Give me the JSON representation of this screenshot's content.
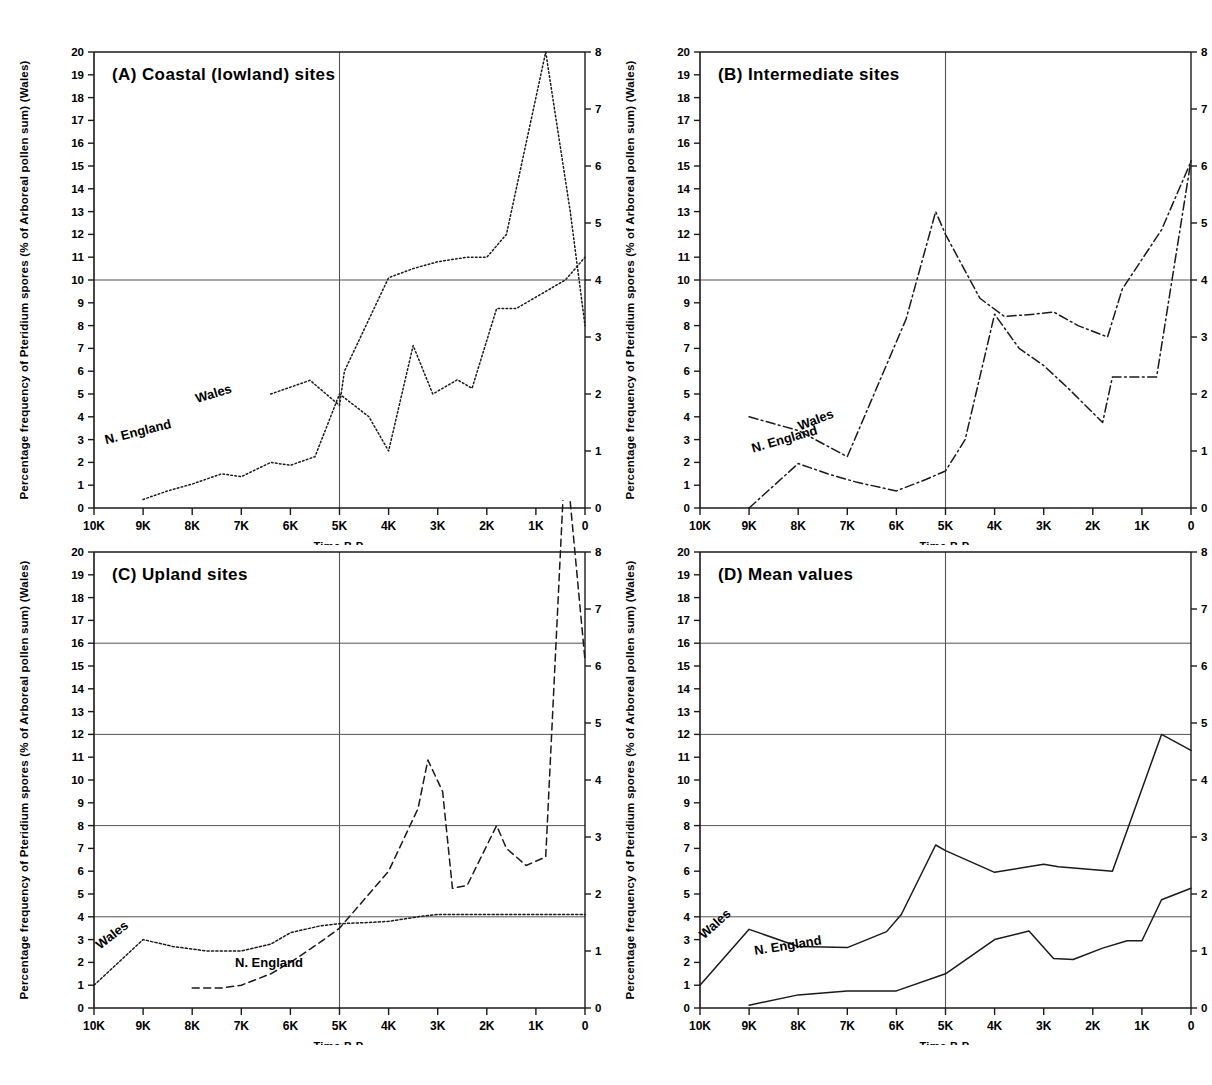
{
  "figure": {
    "background": "#ffffff",
    "line_color": "#1a1a1a",
    "grid_color": "#555555",
    "axis_label_left": "Percentage frequency of Pteridium spores (% of Arboreal pollen sum) (Wales)",
    "axis_label_right_line1": "Percentage frequency of Pteridium spores",
    "axis_label_right_line2": "(% of total Terrestrial pollen) (N. England)",
    "xaxis_title": "Time B.P.",
    "series_label_wales": "Wales",
    "series_label_nengland": "N. England",
    "left_axis_ticks": [
      "0",
      "1",
      "2",
      "3",
      "4",
      "5",
      "6",
      "7",
      "8",
      "9",
      "10",
      "11",
      "12",
      "13",
      "14",
      "15",
      "16",
      "17",
      "18",
      "19",
      "20"
    ],
    "right_axis_ticks": [
      "0",
      "1",
      "2",
      "3",
      "4",
      "5",
      "6",
      "7",
      "8"
    ],
    "x_axis_ticks": [
      "10K",
      "9K",
      "8K",
      "7K",
      "6K",
      "5K",
      "4K",
      "3K",
      "2K",
      "1K",
      "0"
    ]
  },
  "chart_data": [
    {
      "id": "A",
      "type": "line",
      "title": "(A)  Coastal (lowland) sites",
      "xlabel": "Time B.P.",
      "ylabel": "Percentage frequency of Pteridium spores (% of Arboreal pollen sum) (Wales)",
      "ylabel_right": "Percentage frequency of Pteridium spores (% of total Terrestrial pollen) (N. England)",
      "xlim": [
        10000,
        0
      ],
      "ylim_left": [
        0,
        20
      ],
      "ylim_right": [
        0,
        8
      ],
      "grid": true,
      "gridlines_y": [
        10
      ],
      "gridlines_x": [
        5000
      ],
      "legend_position": "inline-annotation",
      "series": [
        {
          "name": "Wales",
          "axis": "left",
          "linestyle": "dotted",
          "x": [
            6400,
            5600,
            5000,
            4900,
            4000,
            3500,
            3000,
            2400,
            2000,
            1600,
            800,
            300,
            0
          ],
          "values": [
            5.0,
            5.6,
            4.5,
            6.0,
            10.1,
            10.5,
            10.8,
            11.0,
            11.0,
            12.0,
            20.0,
            13.0,
            8.0
          ]
        },
        {
          "name": "N. England",
          "axis": "right",
          "linestyle": "dotted",
          "x": [
            9000,
            8500,
            8000,
            7400,
            7000,
            6400,
            6000,
            5500,
            5000,
            4400,
            4000,
            3500,
            3100,
            2600,
            2300,
            1800,
            1400,
            800,
            400,
            0
          ],
          "values": [
            0.15,
            0.3,
            0.42,
            0.6,
            0.55,
            0.8,
            0.75,
            0.9,
            2.0,
            1.6,
            1.0,
            2.85,
            2.0,
            2.25,
            2.1,
            3.5,
            3.5,
            3.8,
            4.0,
            4.4
          ]
        }
      ]
    },
    {
      "id": "B",
      "type": "line",
      "title": "(B)  Intermediate sites",
      "xlabel": "Time B.P.",
      "ylabel": "Percentage frequency of Pteridium spores (% of Arboreal pollen sum) (Wales)",
      "ylabel_right": "Percentage frequency of Pteridium spores (% of total Terrestrial pollen) (N. England)",
      "xlim": [
        10000,
        0
      ],
      "ylim_left": [
        0,
        20
      ],
      "ylim_right": [
        0,
        8
      ],
      "grid": true,
      "gridlines_y": [
        10
      ],
      "gridlines_x": [
        5000
      ],
      "legend_position": "inline-annotation",
      "series": [
        {
          "name": "Wales",
          "axis": "left",
          "linestyle": "dashdot",
          "x": [
            9000,
            8000,
            7000,
            5800,
            5200,
            5000,
            4300,
            3800,
            3200,
            2800,
            2300,
            1700,
            1400,
            600,
            0
          ],
          "values": [
            4.0,
            3.4,
            2.25,
            8.3,
            13.0,
            12.0,
            9.2,
            8.4,
            8.5,
            8.6,
            8.0,
            7.5,
            9.6,
            12.2,
            15.2
          ]
        },
        {
          "name": "N. England",
          "axis": "right",
          "linestyle": "dashdot",
          "x": [
            9000,
            8000,
            7400,
            6800,
            6000,
            5400,
            5000,
            4600,
            4000,
            3500,
            3000,
            2500,
            1800,
            1600,
            1000,
            700,
            0
          ],
          "values": [
            0.0,
            0.78,
            0.6,
            0.45,
            0.3,
            0.5,
            0.65,
            1.2,
            3.4,
            2.8,
            2.5,
            2.1,
            1.5,
            2.3,
            2.3,
            2.3,
            6.1
          ]
        }
      ]
    },
    {
      "id": "C",
      "type": "line",
      "title": "(C)  Upland sites",
      "xlabel": "Time B.P.",
      "ylabel": "Percentage frequency of Pteridium spores (% of Arboreal pollen sum) (Wales)",
      "ylabel_right": "Percentage frequency of Pteridium spores (% of total Terrestrial pollen) (N. England)",
      "xlim": [
        10000,
        0
      ],
      "ylim_left": [
        0,
        20
      ],
      "ylim_right": [
        0,
        8
      ],
      "grid": true,
      "gridlines_y": [
        4,
        8,
        12,
        16
      ],
      "gridlines_x": [
        5000
      ],
      "legend_position": "inline-annotation",
      "series": [
        {
          "name": "Wales",
          "axis": "left",
          "linestyle": "dotted-fine",
          "x": [
            10000,
            9000,
            8400,
            7700,
            7000,
            6400,
            6000,
            5400,
            5000,
            4400,
            4000,
            3400,
            3000,
            2500,
            2000,
            1500,
            1000,
            500,
            0
          ],
          "values": [
            1.0,
            3.0,
            2.7,
            2.5,
            2.5,
            2.8,
            3.3,
            3.6,
            3.7,
            3.75,
            3.8,
            4.0,
            4.1,
            4.1,
            4.1,
            4.1,
            4.1,
            4.1,
            4.1
          ]
        },
        {
          "name": "N. England",
          "axis": "right",
          "linestyle": "dashed",
          "x": [
            8000,
            7400,
            7000,
            6400,
            6000,
            5400,
            5000,
            4500,
            4000,
            3400,
            3200,
            2900,
            2700,
            2400,
            1800,
            1600,
            1200,
            800,
            400,
            0
          ],
          "values": [
            0.35,
            0.35,
            0.4,
            0.6,
            0.8,
            1.15,
            1.4,
            1.9,
            2.4,
            3.5,
            4.35,
            3.8,
            2.1,
            2.15,
            3.2,
            2.8,
            2.5,
            2.65,
            9.8,
            6.1
          ]
        }
      ]
    },
    {
      "id": "D",
      "type": "line",
      "title": "(D)  Mean values",
      "xlabel": "Time B.P.",
      "ylabel": "Percentage frequency of Pteridium spores (% of Arboreal pollen sum) (Wales)",
      "ylabel_right": "Percentage frequency of Pteridium spores (% of total Terrestrial pollen) (N. England)",
      "xlim": [
        10000,
        0
      ],
      "ylim_left": [
        0,
        20
      ],
      "ylim_right": [
        0,
        8
      ],
      "grid": true,
      "gridlines_y": [
        4,
        8,
        12,
        16
      ],
      "gridlines_x": [
        5000
      ],
      "legend_position": "inline-annotation",
      "series": [
        {
          "name": "Wales",
          "axis": "left",
          "linestyle": "solid",
          "x": [
            10000,
            9000,
            8000,
            7000,
            6200,
            5900,
            5200,
            5000,
            4000,
            3000,
            2700,
            1600,
            1300,
            600,
            0
          ],
          "values": [
            1.0,
            3.45,
            2.7,
            2.65,
            3.35,
            4.1,
            7.15,
            6.9,
            5.95,
            6.3,
            6.2,
            6.0,
            7.8,
            12.0,
            11.3
          ]
        },
        {
          "name": "N. England",
          "axis": "right",
          "linestyle": "solid",
          "x": [
            9000,
            8000,
            7000,
            6000,
            5000,
            4000,
            3300,
            2800,
            2400,
            1800,
            1300,
            1000,
            600,
            0
          ],
          "values": [
            0.05,
            0.23,
            0.3,
            0.3,
            0.6,
            1.2,
            1.35,
            0.87,
            0.85,
            1.05,
            1.18,
            1.18,
            1.9,
            2.1
          ]
        }
      ]
    }
  ]
}
